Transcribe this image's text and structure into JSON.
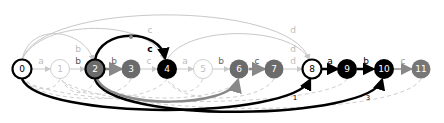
{
  "diagram": {
    "type": "state-automaton",
    "colors": {
      "black": "#000000",
      "dark_gray": "#6b6b6b",
      "mid_gray": "#888888",
      "light_gray": "#c8c8c8",
      "white": "#ffffff"
    },
    "nodes": [
      {
        "id": "0",
        "label": "0",
        "x": 22,
        "style": "outlined-bold"
      },
      {
        "id": "1",
        "label": "1",
        "x": 60,
        "style": "outlined-light"
      },
      {
        "id": "2",
        "label": "2",
        "x": 95,
        "style": "filled-gray-bold-outline"
      },
      {
        "id": "3",
        "label": "3",
        "x": 131,
        "style": "filled-gray"
      },
      {
        "id": "4",
        "label": "4",
        "x": 167,
        "style": "filled-black"
      },
      {
        "id": "5",
        "label": "5",
        "x": 203,
        "style": "outlined-light"
      },
      {
        "id": "6",
        "label": "6",
        "x": 239,
        "style": "filled-gray"
      },
      {
        "id": "7",
        "label": "7",
        "x": 274,
        "style": "filled-gray"
      },
      {
        "id": "8",
        "label": "8",
        "x": 312,
        "style": "outlined-bold"
      },
      {
        "id": "9",
        "label": "9",
        "x": 347,
        "style": "filled-black"
      },
      {
        "id": "10",
        "label": "10",
        "x": 384,
        "style": "filled-black"
      },
      {
        "id": "11",
        "label": "11",
        "x": 421,
        "style": "filled-gray"
      }
    ],
    "chain_edges": [
      {
        "from": "0",
        "to": "1",
        "label": "a"
      },
      {
        "from": "1",
        "to": "2",
        "label": "b"
      },
      {
        "from": "2",
        "to": "3",
        "label": "b"
      },
      {
        "from": "3",
        "to": "4",
        "label": "c"
      },
      {
        "from": "4",
        "to": "5",
        "label": "a"
      },
      {
        "from": "5",
        "to": "6",
        "label": "b"
      },
      {
        "from": "6",
        "to": "7",
        "label": "c"
      },
      {
        "from": "7",
        "to": "8",
        "label": "d"
      },
      {
        "from": "8",
        "to": "9",
        "label": "a",
        "sublabel": "1"
      },
      {
        "from": "9",
        "to": "10",
        "label": "b",
        "sublabel": "2"
      },
      {
        "from": "10",
        "to": "11",
        "label": "c"
      }
    ],
    "top_arcs": [
      {
        "from": "0",
        "to": "2",
        "label": "b"
      },
      {
        "from": "0",
        "to": "4",
        "label": "c"
      },
      {
        "from": "2",
        "to": "4",
        "label": "c"
      },
      {
        "from": "0",
        "to": "8",
        "label": "d"
      },
      {
        "from": "4",
        "to": "8",
        "label": "d"
      }
    ],
    "bottom_arcs": [
      {
        "from": "0",
        "to": "8",
        "label": "1"
      },
      {
        "from": "0",
        "to": "10",
        "label": "3"
      },
      {
        "from": "2",
        "to": "6",
        "label": ""
      }
    ]
  }
}
